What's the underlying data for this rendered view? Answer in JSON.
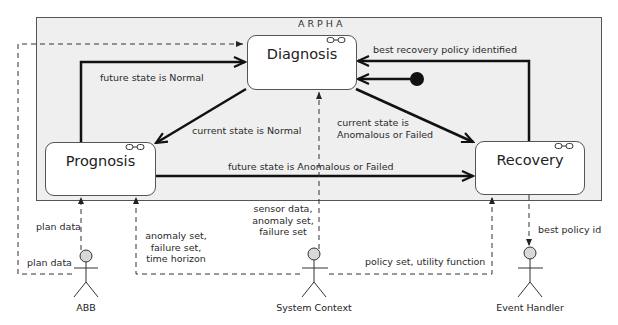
{
  "frame": {
    "title": "ARPHA",
    "background": "#efefef",
    "border": "#555555"
  },
  "states": {
    "diagnosis": {
      "label": "Diagnosis",
      "icon": "link-icon"
    },
    "prognosis": {
      "label": "Prognosis",
      "icon": "link-icon"
    },
    "recovery": {
      "label": "Recovery",
      "icon": "link-icon"
    }
  },
  "initial_state": {
    "icon": "filled-circle-icon"
  },
  "transitions": {
    "prognosis_to_diagnosis": "future state is Normal",
    "diagnosis_to_prognosis": "current state is Normal",
    "diagnosis_to_recovery_line1": "current state is",
    "diagnosis_to_recovery_line2": "Anomalous or Failed",
    "prognosis_to_recovery": "future state is Anomalous or Failed",
    "recovery_to_diagnosis": "best recovery policy identified"
  },
  "data_flows": {
    "abb_to_prognosis": "plan data",
    "abb_to_diagnosis": "plan data",
    "context_to_prognosis_line1": "anomaly set,",
    "context_to_prognosis_line2": "failure set,",
    "context_to_prognosis_line3": "time horizon",
    "context_to_diagnosis_line1": "sensor data,",
    "context_to_diagnosis_line2": "anomaly set,",
    "context_to_diagnosis_line3": "failure set",
    "context_to_recovery": "policy set, utility function",
    "recovery_to_handler": "best policy id"
  },
  "actors": {
    "abb": {
      "label": "ABB"
    },
    "system_context": {
      "label": "System Context"
    },
    "event_handler": {
      "label": "Event Handler"
    }
  }
}
